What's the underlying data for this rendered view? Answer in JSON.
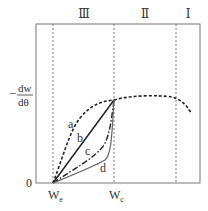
{
  "diagram": {
    "type": "drying-rate-curve",
    "y_axis_label": {
      "numerator": "dw",
      "denominator": "dθ",
      "sign": "−"
    },
    "origin_label": "0",
    "x_ticks": [
      {
        "label": "W",
        "sub": "e"
      },
      {
        "label": "W",
        "sub": "c"
      }
    ],
    "regions": [
      {
        "label": "Ⅲ"
      },
      {
        "label": "Ⅱ"
      },
      {
        "label": "Ⅰ"
      }
    ],
    "curves": [
      {
        "label": "a",
        "style": "dashed"
      },
      {
        "label": "b",
        "style": "solid"
      },
      {
        "label": "c",
        "style": "dash-dot"
      },
      {
        "label": "d",
        "style": "solid-gray"
      }
    ],
    "colors": {
      "frame": "#777777",
      "curve": "#222222",
      "curve_d": "#666666",
      "guide": "#555555"
    }
  }
}
